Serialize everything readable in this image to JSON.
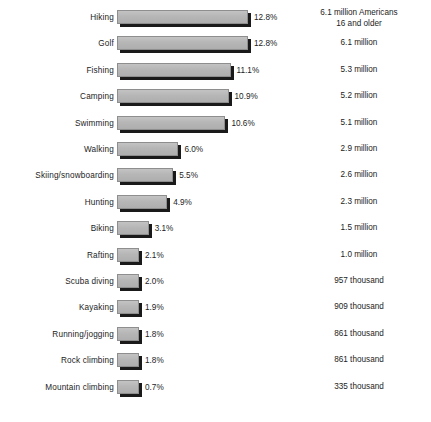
{
  "chart_data": {
    "type": "bar",
    "orientation": "horizontal",
    "title": "",
    "subtitle": "",
    "xlabel": "",
    "ylabel": "",
    "grid": false,
    "legend": "none",
    "xlim": [
      0,
      12.8
    ],
    "value_suffix": "%",
    "categories": [
      "Hiking",
      "Golf",
      "Fishing",
      "Camping",
      "Swimming",
      "Walking",
      "Skiing/snowboarding",
      "Hunting",
      "Biking",
      "Rafting",
      "Scuba diving",
      "Kayaking",
      "Running/jogging",
      "Rock climbing",
      "Mountain climbing"
    ],
    "values": [
      12.8,
      12.8,
      11.1,
      10.9,
      10.6,
      6.0,
      5.5,
      4.9,
      3.1,
      2.1,
      2.0,
      1.9,
      1.8,
      1.8,
      0.7
    ],
    "value_labels": [
      "12.8%",
      "12.8%",
      "11.1%",
      "10.9%",
      "10.6%",
      "6.0%",
      "5.5%",
      "4.9%",
      "3.1%",
      "2.1%",
      "2.0%",
      "1.9%",
      "1.8%",
      "1.8%",
      "0.7%"
    ],
    "annotations": [
      "6.1 million Americans\n16 and older",
      "6.1 million",
      "5.3 million",
      "5.2 million",
      "5.1 million",
      "2.9 million",
      "2.6 million",
      "2.3 million",
      "1.5 million",
      "1.0 million",
      "957 thousand",
      "909 thousand",
      "861 thousand",
      "861 thousand",
      "335 thousand"
    ],
    "series": [
      {
        "name": "Participation rate",
        "values": [
          12.8,
          12.8,
          11.1,
          10.9,
          10.6,
          6.0,
          5.5,
          4.9,
          3.1,
          2.1,
          2.0,
          1.9,
          1.8,
          1.8,
          0.7
        ]
      }
    ]
  },
  "colors": {
    "background": "#ffffff",
    "bar_fill": "#b6b6b6",
    "bar_border": "#8e8e8e",
    "bar_shadow": "#1a1a1a",
    "text": "#1c1c1c"
  },
  "rows": [
    {
      "category": "Hiking",
      "value_label": "12.8%",
      "annotation": "6.1 million Americans\n16 and older"
    },
    {
      "category": "Golf",
      "value_label": "12.8%",
      "annotation": "6.1 million"
    },
    {
      "category": "Fishing",
      "value_label": "11.1%",
      "annotation": "5.3 million"
    },
    {
      "category": "Camping",
      "value_label": "10.9%",
      "annotation": "5.2 million"
    },
    {
      "category": "Swimming",
      "value_label": "10.6%",
      "annotation": "5.1 million"
    },
    {
      "category": "Walking",
      "value_label": "6.0%",
      "annotation": "2.9 million"
    },
    {
      "category": "Skiing/snowboarding",
      "value_label": "5.5%",
      "annotation": "2.6 million"
    },
    {
      "category": "Hunting",
      "value_label": "4.9%",
      "annotation": "2.3 million"
    },
    {
      "category": "Biking",
      "value_label": "3.1%",
      "annotation": "1.5 million"
    },
    {
      "category": "Rafting",
      "value_label": "2.1%",
      "annotation": "1.0 million"
    },
    {
      "category": "Scuba diving",
      "value_label": "2.0%",
      "annotation": "957 thousand"
    },
    {
      "category": "Kayaking",
      "value_label": "1.9%",
      "annotation": "909 thousand"
    },
    {
      "category": "Running/jogging",
      "value_label": "1.8%",
      "annotation": "861 thousand"
    },
    {
      "category": "Rock climbing",
      "value_label": "1.8%",
      "annotation": "861 thousand"
    },
    {
      "category": "Mountain climbing",
      "value_label": "0.7%",
      "annotation": "335 thousand"
    }
  ]
}
